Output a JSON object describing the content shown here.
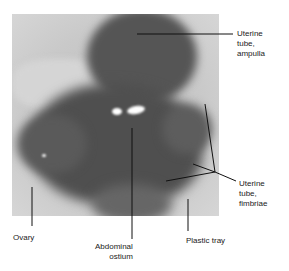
{
  "figure": {
    "type": "labeled anatomical photograph",
    "colors": {
      "background": "#ffffff",
      "label_text": "#222222",
      "leader_line": "#111111"
    }
  },
  "labels": {
    "ampulla": "Uterine\ntube,\nampulla",
    "fimbriae": "Uterine\ntube,\nfimbriae",
    "ovary": "Ovary",
    "ostium": "Abdominal\nostium",
    "tray": "Plastic tray"
  }
}
